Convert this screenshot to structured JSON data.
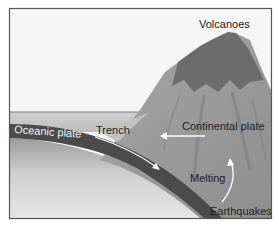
{
  "diagram": {
    "labels": {
      "volcanoes": "Volcanoes",
      "trench": "Trench",
      "oceanic_plate": "Oceanic plate",
      "continental_plate": "Continental plate",
      "melting": "Melting",
      "earthquakes": "Earthquakes"
    },
    "arrows": [
      {
        "name": "subduction-direction",
        "description": "Oceanic plate moving down toward the continental plate"
      },
      {
        "name": "continental-plate-motion",
        "description": "Continental plate moving left toward the trench"
      },
      {
        "name": "magma-rise",
        "description": "Melted material rising upward"
      }
    ],
    "colors": {
      "frame": "#555555",
      "sky": "#f4f4f4",
      "sea": "#c9c9c9",
      "mantle_light": "#d8d8d8",
      "mantle_dark": "#9e9e9e",
      "oceanic_plate": "#4a4a4a",
      "continental_plate": "#9a9a9a",
      "volcano_peak": "#6e6e6e",
      "arrow": "#ffffff"
    }
  }
}
